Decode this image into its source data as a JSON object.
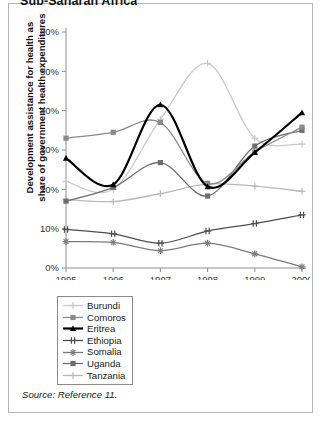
{
  "figure": {
    "title": "Sub-Saharan Africa",
    "source_note": "Source: Reference 11."
  },
  "legend": {
    "entries": [
      {
        "label": "Burundi",
        "color": "#c9c9c9",
        "marker": "plus"
      },
      {
        "label": "Comoros",
        "color": "#8a8a8a",
        "marker": "square"
      },
      {
        "label": "Eritrea",
        "color": "#000000",
        "marker": "triangle"
      },
      {
        "label": "Ethiopia",
        "color": "#4f4f4f",
        "marker": "doubleplus"
      },
      {
        "label": "Somalia",
        "color": "#7b7b7b",
        "marker": "star"
      },
      {
        "label": "Uganda",
        "color": "#6e6e6e",
        "marker": "square"
      },
      {
        "label": "Tanzania",
        "color": "#b9b9b9",
        "marker": "plus"
      }
    ]
  },
  "chart_data": {
    "type": "line",
    "title": "Sub-Saharan Africa",
    "xlabel": "",
    "ylabel": "Development assistance for health as share of government health expenditures",
    "x": [
      1995,
      1996,
      1997,
      1998,
      1999,
      2000
    ],
    "xtick_labels": [
      "1995",
      "1996",
      "1997",
      "1998",
      "1999",
      "2000"
    ],
    "ytick_labels": [
      "0%",
      "10%",
      "20%",
      "30%",
      "40%",
      "50%",
      "60%"
    ],
    "ytick_values": [
      0,
      10,
      20,
      30,
      40,
      50,
      60
    ],
    "ylim": [
      0,
      60
    ],
    "y_unit": "%",
    "grid": false,
    "legend_position": "below-plot",
    "smoothing": "spline",
    "series": [
      {
        "name": "Burundi",
        "color": "#c9c9c9",
        "marker": "plus",
        "values": [
          22.0,
          20.0,
          37.8,
          52.0,
          33.0,
          31.5
        ]
      },
      {
        "name": "Comoros",
        "color": "#8a8a8a",
        "marker": "square",
        "values": [
          33.0,
          34.5,
          37.0,
          21.5,
          29.5,
          35.8
        ]
      },
      {
        "name": "Eritrea",
        "color": "#000000",
        "marker": "triangle",
        "values": [
          27.9,
          21.2,
          41.5,
          20.7,
          29.4,
          39.5
        ]
      },
      {
        "name": "Ethiopia",
        "color": "#4f4f4f",
        "marker": "doubleplus",
        "values": [
          9.8,
          8.7,
          6.3,
          9.4,
          11.3,
          13.5
        ]
      },
      {
        "name": "Somalia",
        "color": "#7b7b7b",
        "marker": "star",
        "values": [
          6.7,
          6.5,
          4.4,
          6.3,
          3.6,
          0.3
        ]
      },
      {
        "name": "Uganda",
        "color": "#6e6e6e",
        "marker": "square",
        "values": [
          17.0,
          20.5,
          26.8,
          18.3,
          31.0,
          35.0
        ]
      },
      {
        "name": "Tanzania",
        "color": "#b9b9b9",
        "marker": "plus",
        "values": [
          17.4,
          16.9,
          18.9,
          21.4,
          20.8,
          19.5
        ]
      }
    ]
  }
}
